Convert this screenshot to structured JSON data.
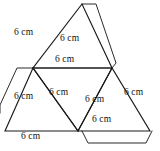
{
  "figure": {
    "shape_type": "triangular-pyramid-net",
    "unit": "cm",
    "edge_length": 6,
    "line_color": "#1a1a1a",
    "background_color": "#ffffff",
    "faces": [
      {
        "name": "top-triangle",
        "points": "82,4 33,68 112,68"
      },
      {
        "name": "left-triangle",
        "points": "33,68 5,131 78,131"
      },
      {
        "name": "middle-triangle",
        "points": "33,68 112,68 78,131"
      },
      {
        "name": "right-triangle",
        "points": "112,68 78,131 150,131"
      }
    ],
    "flaps": [
      {
        "name": "top-apex-flap",
        "points": "82,4 96,4 116,63"
      },
      {
        "name": "left-side-flap",
        "points": "33,68 17,68 0,105"
      },
      {
        "name": "bottom-right-flap",
        "points": "82,131 88,143 146,143 152,131"
      }
    ],
    "labels": [
      {
        "name": "label-top-left-edge",
        "text": "6 cm",
        "x": 14,
        "y": 27
      },
      {
        "name": "label-top-interior",
        "text": "6 cm",
        "x": 60,
        "y": 33
      },
      {
        "name": "label-middle-top-edge",
        "text": "6 cm",
        "x": 55,
        "y": 54
      },
      {
        "name": "label-left-interior",
        "text": "6 cm",
        "x": 14,
        "y": 91
      },
      {
        "name": "label-center-interior",
        "text": "6 cm",
        "x": 49,
        "y": 87
      },
      {
        "name": "label-right-interior",
        "text": "6 cm",
        "x": 85,
        "y": 94
      },
      {
        "name": "label-right-outer-edge",
        "text": "6 cm",
        "x": 124,
        "y": 87
      },
      {
        "name": "label-bottom-right-edge",
        "text": "6 cm",
        "x": 92,
        "y": 114
      },
      {
        "name": "label-bottom-left-edge",
        "text": "6 cm",
        "x": 21,
        "y": 131
      }
    ]
  }
}
